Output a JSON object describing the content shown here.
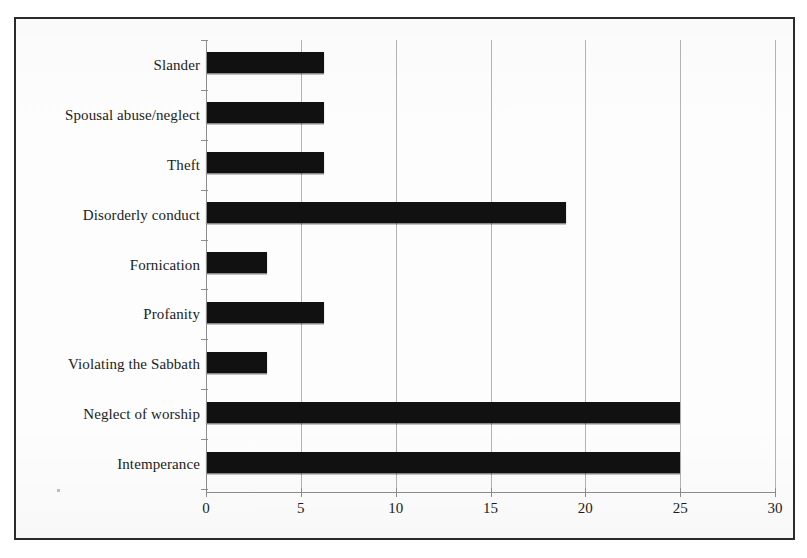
{
  "figure": {
    "background_color": "#fdfdfd",
    "frame_color": "#2b2b2b",
    "bar_color": "#111111",
    "grid_color": "#b4b4b4",
    "axis_color": "#8d8d8d"
  },
  "chart_data": {
    "type": "bar",
    "orientation": "horizontal",
    "title": "",
    "subtitle": "",
    "xlabel": "",
    "ylabel": "",
    "xlim": [
      0,
      30
    ],
    "xticks": [
      "0",
      "5",
      "10",
      "15",
      "20",
      "25",
      "30"
    ],
    "grid": true,
    "legend": null,
    "categories": [
      "Slander",
      "Spousal abuse/neglect",
      "Theft",
      "Disorderly conduct",
      "Fornication",
      "Profanity",
      "Violating the Sabbath",
      "Neglect of worship",
      "Intemperance"
    ],
    "values": [
      6.2,
      6.2,
      6.2,
      19,
      3.2,
      6.2,
      3.2,
      25,
      25
    ],
    "value_labels": [
      "",
      "",
      "",
      "",
      "",
      "",
      "",
      "",
      ""
    ]
  }
}
